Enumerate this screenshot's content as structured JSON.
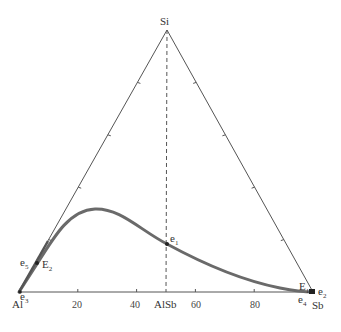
{
  "diagram": {
    "type": "ternary-phase-diagram",
    "vertices": {
      "top": "Si",
      "left": "Al",
      "right": "Sb"
    },
    "bottom_axis_ticks": [
      20,
      40,
      60,
      80
    ],
    "compound": {
      "label": "AlSb",
      "position": 50
    },
    "points": [
      {
        "name": "e",
        "sub": "1"
      },
      {
        "name": "e",
        "sub": "2"
      },
      {
        "name": "e",
        "sub": "3"
      },
      {
        "name": "e",
        "sub": "4"
      },
      {
        "name": "e",
        "sub": "5"
      },
      {
        "name": "E",
        "sub": "1"
      },
      {
        "name": "E",
        "sub": "2"
      }
    ],
    "colors": {
      "frame": "#555555",
      "curve": "#6a6a6a",
      "text": "#333333"
    }
  }
}
